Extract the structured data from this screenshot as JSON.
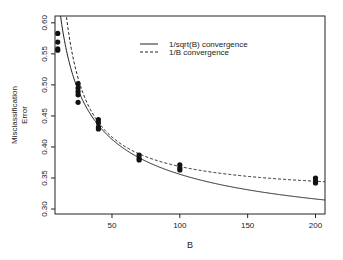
{
  "chart_data": {
    "type": "scatter",
    "title": "",
    "xlabel": "B",
    "ylabel": "Misclassification Error",
    "xlim": [
      8,
      207
    ],
    "ylim": [
      0.292,
      0.611
    ],
    "xticks": [
      50,
      100,
      150,
      200
    ],
    "yticks": [
      0.3,
      0.35,
      0.4,
      0.45,
      0.5,
      0.55,
      0.6
    ],
    "ytick_labels": [
      "0.30",
      "0.35",
      "0.40",
      "0.45",
      "0.50",
      "0.55",
      "0.60"
    ],
    "grid": false,
    "legend_position": "top-center",
    "points": [
      {
        "x": 10,
        "y": [
          0.583,
          0.569,
          0.558,
          0.556
        ]
      },
      {
        "x": 25,
        "y": [
          0.502,
          0.495,
          0.489,
          0.484,
          0.472
        ]
      },
      {
        "x": 40,
        "y": [
          0.444,
          0.439,
          0.432,
          0.429
        ]
      },
      {
        "x": 70,
        "y": [
          0.387,
          0.382,
          0.379
        ]
      },
      {
        "x": 100,
        "y": [
          0.371,
          0.366,
          0.363
        ]
      },
      {
        "x": 200,
        "y": [
          0.35,
          0.345,
          0.342
        ]
      }
    ],
    "series": [
      {
        "name": "1/sqrt(B) convergence",
        "style": "solid",
        "model": "a + b/sqrt(B)",
        "a": 0.22,
        "b": 1.36
      },
      {
        "name": "1/B convergence",
        "style": "dashed",
        "model": "a + b/B",
        "a": 0.321,
        "b": 4.75
      }
    ]
  },
  "legend": {
    "items": [
      {
        "label": "1/sqrt(B) convergence",
        "style": "solid"
      },
      {
        "label": "1/B convergence",
        "style": "dashed"
      }
    ]
  },
  "axes": {
    "xlabel": "B",
    "ylabel_line1": "Misclassification",
    "ylabel_line2": "Error"
  },
  "colors": {
    "ink": "#222222",
    "points": "#111111"
  }
}
